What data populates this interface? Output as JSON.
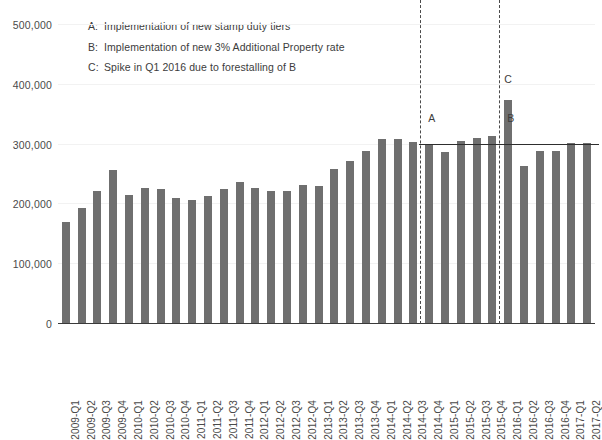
{
  "chart_data": {
    "type": "bar",
    "title": "",
    "xlabel": "",
    "ylabel": "",
    "ylim": [
      0,
      500000
    ],
    "yticks": [
      0,
      100000,
      200000,
      300000,
      400000,
      500000
    ],
    "ytick_labels": [
      "0",
      "100,000",
      "200,000",
      "300,000",
      "400,000",
      "500,000"
    ],
    "grid": false,
    "legend_position": "none",
    "bar_color": "#6f6f6f",
    "categories": [
      "2009-Q1",
      "2009-Q2",
      "2009-Q3",
      "2009-Q4",
      "2010-Q1",
      "2010-Q2",
      "2010-Q3",
      "2010-Q4",
      "2011-Q1",
      "2011-Q2",
      "2011-Q3",
      "2011-Q4",
      "2012-Q1",
      "2012-Q2",
      "2012-Q3",
      "2012-Q4",
      "2013-Q1",
      "2013-Q2",
      "2013-Q3",
      "2013-Q4",
      "2014-Q1",
      "2014-Q2",
      "2014-Q3",
      "2014-Q4",
      "2015-Q1",
      "2015-Q2",
      "2015-Q3",
      "2015-Q4",
      "2016-Q1",
      "2016-Q2",
      "2016-Q3",
      "2016-Q4",
      "2017-Q1",
      "2017-Q2"
    ],
    "values": [
      171000,
      194000,
      222000,
      258000,
      215000,
      227000,
      226000,
      210000,
      208000,
      214000,
      226000,
      238000,
      227000,
      222000,
      222000,
      233000,
      230000,
      260000,
      272000,
      290000,
      310000,
      309000,
      304000,
      300000,
      288000,
      306000,
      311000,
      315000,
      375000,
      264000,
      290000,
      290000,
      303000,
      303000
    ],
    "reference_line": {
      "value": 300000,
      "start_category": "2014-Q4",
      "end_category": "2017-Q2",
      "color": "#2e2e2e"
    },
    "event_lines": [
      {
        "label": "A",
        "at_category": "2014-Q4",
        "style": "dashed"
      },
      {
        "label": "B",
        "at_category": "2016-Q1",
        "style": "dashed"
      }
    ],
    "point_annotations": [
      {
        "label": "C",
        "at_category": "2016-Q1",
        "value": 375000
      }
    ],
    "annotations": [
      {
        "key": "A:",
        "text": "Implementation of new stamp duty tiers"
      },
      {
        "key": "B:",
        "text": "Implementation of new 3% Additional Property rate"
      },
      {
        "key": "C:",
        "text": "Spike in Q1 2016 due to forestalling of B"
      }
    ]
  }
}
